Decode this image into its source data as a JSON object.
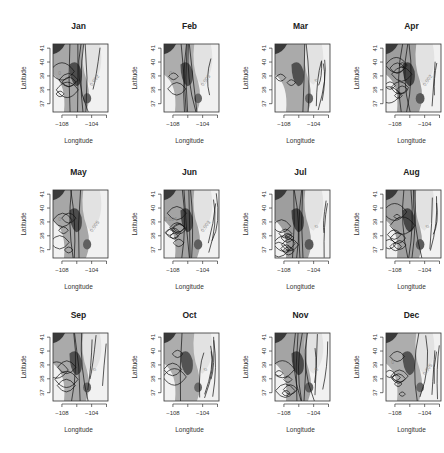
{
  "chart_data": {
    "type": "heatmap",
    "title": "",
    "layout": {
      "rows": 3,
      "cols": 4
    },
    "xlabel": "Longitude",
    "ylabel": "Latitude",
    "xlim": [
      -109.2,
      -101.8
    ],
    "ylim": [
      36.4,
      41.3
    ],
    "xticks": [
      -108,
      -106,
      -104,
      -102
    ],
    "xtick_labels": [
      "−108",
      "",
      "−104",
      ""
    ],
    "yticks": [
      37,
      38,
      39,
      40,
      41
    ],
    "ytick_labels": [
      "37",
      "38",
      "39",
      "40",
      "41"
    ],
    "colorscale": "grayscale (white = low, black = high)",
    "grid": false,
    "legend": "none",
    "panels": [
      {
        "month": "Jan",
        "contour_labels": [
          "0.002",
          "0"
        ],
        "contour_density": 0.6,
        "shade": 0.55
      },
      {
        "month": "Feb",
        "contour_labels": [
          "0.005",
          "0"
        ],
        "contour_density": 0.3,
        "shade": 0.45
      },
      {
        "month": "Mar",
        "contour_labels": [
          "0"
        ],
        "contour_density": 0.35,
        "shade": 0.5
      },
      {
        "month": "Apr",
        "contour_labels": [
          "0.002"
        ],
        "contour_density": 0.85,
        "shade": 0.7
      },
      {
        "month": "May",
        "contour_labels": [
          "0.005",
          "0"
        ],
        "contour_density": 0.35,
        "shade": 0.55
      },
      {
        "month": "Jun",
        "contour_labels": [
          "0.003",
          "0.004"
        ],
        "contour_density": 0.9,
        "shade": 0.6
      },
      {
        "month": "Jul",
        "contour_labels": [
          "0"
        ],
        "contour_density": 0.95,
        "shade": 0.7
      },
      {
        "month": "Aug",
        "contour_labels": [
          "0"
        ],
        "contour_density": 0.9,
        "shade": 0.65
      },
      {
        "month": "Sep",
        "contour_labels": [
          "0"
        ],
        "contour_density": 0.5,
        "shade": 0.5
      },
      {
        "month": "Oct",
        "contour_labels": [
          "0"
        ],
        "contour_density": 0.45,
        "shade": 0.45
      },
      {
        "month": "Nov",
        "contour_labels": [
          "0"
        ],
        "contour_density": 0.85,
        "shade": 0.6
      },
      {
        "month": "Dec",
        "contour_labels": [
          "0.005",
          "0"
        ],
        "contour_density": 0.7,
        "shade": 0.45
      }
    ]
  }
}
